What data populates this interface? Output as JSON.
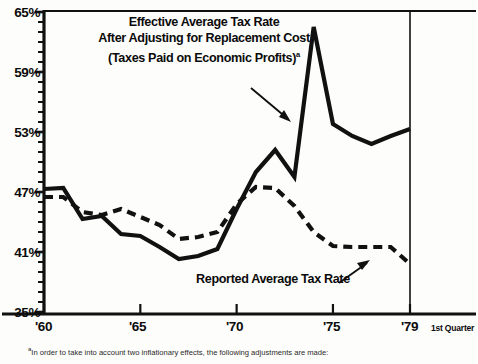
{
  "chart_data": {
    "type": "line",
    "title": "Effective Average Tax Rate After Adjusting for Replacement Cost (Taxes Paid on Economic Profits)",
    "title_lines": [
      "Effective Average Tax Rate",
      "After Adjusting for Replacement Cost",
      "(Taxes Paid on Economic Profits)"
    ],
    "title_superscript": "a",
    "xlabel": "",
    "ylabel": "",
    "xlim": [
      1960,
      1979
    ],
    "ylim": [
      35,
      65
    ],
    "ytick_labels": [
      "65%",
      "59%",
      "53%",
      "47%",
      "41%",
      "35%"
    ],
    "ytick_values": [
      65,
      59,
      53,
      47,
      41,
      35
    ],
    "yminor_step": 1,
    "xtick_labels": [
      "'60",
      "'65",
      "'70",
      "'75",
      "'79"
    ],
    "xtick_values": [
      1960,
      1965,
      1970,
      1975,
      1979
    ],
    "x_axis_suffix": "1st Quarter",
    "grid": false,
    "legend_position": "inline-annotations",
    "x": [
      1960,
      1961,
      1962,
      1963,
      1964,
      1965,
      1966,
      1967,
      1968,
      1969,
      1970,
      1971,
      1972,
      1973,
      1974,
      1975,
      1976,
      1977,
      1978,
      1979
    ],
    "series": [
      {
        "name": "Effective Average Tax Rate After Adjusting for Replacement Cost",
        "style": "solid",
        "color": "#111111",
        "values": [
          47.3,
          47.4,
          44.3,
          44.6,
          42.8,
          42.6,
          41.5,
          40.3,
          40.6,
          41.3,
          45.3,
          49.0,
          51.2,
          48.5,
          63.5,
          53.8,
          52.6,
          51.8,
          52.6,
          53.3
        ]
      },
      {
        "name": "Reported Average Tax Rate",
        "style": "dashed",
        "color": "#111111",
        "values": [
          46.5,
          46.5,
          45.0,
          44.7,
          45.3,
          44.5,
          43.7,
          42.3,
          42.5,
          43.0,
          45.8,
          47.5,
          47.4,
          45.6,
          43.0,
          41.6,
          41.5,
          41.5,
          41.5,
          39.8
        ]
      }
    ],
    "annotations": [
      {
        "name": "effective-rate-label",
        "text": "Effective Average Tax Rate After Adjusting for Replacement Cost (Taxes Paid on Economic Profits)",
        "points_to_x": 1973.7,
        "points_to_y": 58.5
      },
      {
        "name": "reported-rate-label",
        "text": "Reported Average Tax Rate",
        "points_to_x": 1976.3,
        "points_to_y": 41.5
      }
    ]
  },
  "chart": {
    "series_label_reported": "Reported Average Tax Rate"
  },
  "footnote": {
    "marker": "a",
    "text": "In order to take into account two inflationary effects, the following adjustments are made:"
  }
}
